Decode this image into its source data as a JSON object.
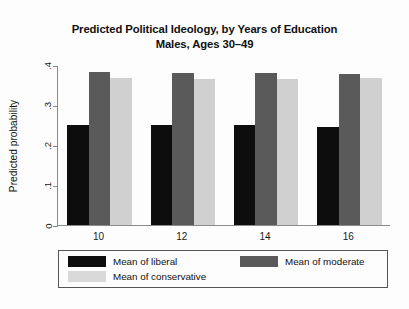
{
  "chart_data": {
    "type": "bar",
    "title": "Predicted Political Ideology, by Years of Education\nMales, Ages 30–49",
    "title_line1": "Predicted Political Ideology, by Years of Education",
    "title_line2": "Males, Ages 30–49",
    "xlabel": "",
    "ylabel": "Predicted probability",
    "categories": [
      "10",
      "12",
      "14",
      "16"
    ],
    "ylim": [
      0,
      0.4
    ],
    "yticks": [
      0,
      0.1,
      0.2,
      0.3,
      0.4
    ],
    "ytick_labels": [
      "0",
      ".1",
      ".2",
      ".3",
      ".4"
    ],
    "grid": false,
    "legend_position": "bottom",
    "series": [
      {
        "name": "Mean of liberal",
        "color": "#0d0d0d",
        "values": [
          0.25,
          0.251,
          0.25,
          0.245
        ]
      },
      {
        "name": "Mean of moderate",
        "color": "#5a5a5a",
        "values": [
          0.382,
          0.38,
          0.38,
          0.378
        ]
      },
      {
        "name": "Mean of conservative",
        "color": "#d0d0d0",
        "values": [
          0.368,
          0.366,
          0.366,
          0.368
        ]
      }
    ]
  }
}
